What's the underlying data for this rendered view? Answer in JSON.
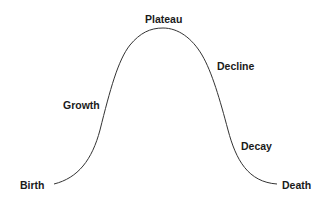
{
  "diagram": {
    "type": "lifecycle-curve",
    "stages": [
      {
        "id": "birth",
        "label": "Birth"
      },
      {
        "id": "growth",
        "label": "Growth"
      },
      {
        "id": "plateau",
        "label": "Plateau"
      },
      {
        "id": "decline",
        "label": "Decline"
      },
      {
        "id": "decay",
        "label": "Decay"
      },
      {
        "id": "death",
        "label": "Death"
      }
    ],
    "curve_color": "#333333",
    "text_color": "#1a1a1a"
  }
}
